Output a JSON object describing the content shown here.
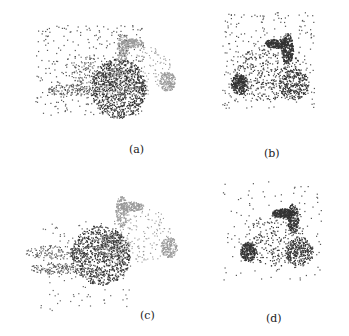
{
  "figure": {
    "panels": [
      {
        "id": "a",
        "label": "(a)",
        "description": "Misaligned bunny point cloud with dark rotated copy and noise"
      },
      {
        "id": "b",
        "label": "(b)",
        "description": "Aligned bunny point cloud with noise"
      },
      {
        "id": "c",
        "label": "(c)",
        "description": "Misaligned bunny point cloud with dark rotated copy"
      },
      {
        "id": "d",
        "label": "(d)",
        "description": "Aligned bunny point cloud with sparse noise"
      }
    ]
  }
}
